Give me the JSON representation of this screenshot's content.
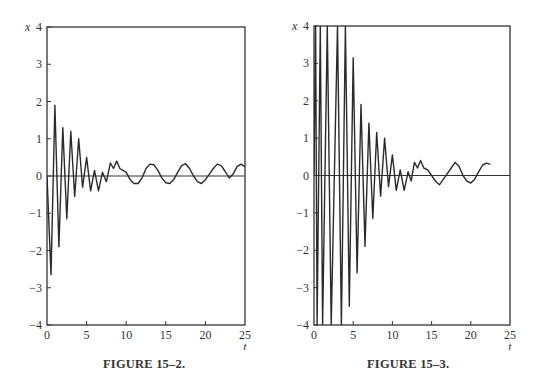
{
  "chart_data": [
    {
      "type": "line",
      "caption": "FIGURE 15–2.",
      "xlabel": "t",
      "ylabel": "x",
      "xlim": [
        0,
        25
      ],
      "ylim": [
        -4,
        4
      ],
      "xticks": [
        0,
        5,
        10,
        15,
        20,
        25
      ],
      "yticks": [
        -4,
        -3,
        -2,
        -1,
        0,
        1,
        2,
        3,
        4
      ],
      "grid": false,
      "baseline": 0,
      "series": [
        {
          "name": "x(t)",
          "points": [
            [
              0,
              0
            ],
            [
              0.5,
              -2.65
            ],
            [
              1.0,
              1.9
            ],
            [
              1.5,
              -1.9
            ],
            [
              2.0,
              1.3
            ],
            [
              2.5,
              -1.15
            ],
            [
              3.0,
              1.2
            ],
            [
              3.5,
              -0.55
            ],
            [
              4.0,
              1.0
            ],
            [
              4.5,
              -0.3
            ],
            [
              5.0,
              0.5
            ],
            [
              5.5,
              -0.4
            ],
            [
              6.0,
              0.15
            ],
            [
              6.5,
              -0.4
            ],
            [
              7.0,
              0.1
            ],
            [
              7.5,
              -0.15
            ],
            [
              8.0,
              0.35
            ],
            [
              8.4,
              0.2
            ],
            [
              8.8,
              0.4
            ],
            [
              9.2,
              0.2
            ],
            [
              9.6,
              0.15
            ],
            [
              10.0,
              0.1
            ],
            [
              10.5,
              -0.1
            ],
            [
              11.0,
              -0.2
            ],
            [
              11.5,
              -0.2
            ],
            [
              12.0,
              -0.05
            ],
            [
              12.5,
              0.2
            ],
            [
              13.0,
              0.32
            ],
            [
              13.5,
              0.3
            ],
            [
              14.0,
              0.15
            ],
            [
              14.5,
              -0.05
            ],
            [
              15.0,
              -0.18
            ],
            [
              15.5,
              -0.2
            ],
            [
              16.0,
              -0.1
            ],
            [
              16.5,
              0.1
            ],
            [
              17.0,
              0.28
            ],
            [
              17.5,
              0.33
            ],
            [
              18.0,
              0.2
            ],
            [
              18.5,
              0.0
            ],
            [
              19.0,
              -0.15
            ],
            [
              19.5,
              -0.2
            ],
            [
              20.0,
              -0.1
            ],
            [
              20.5,
              0.05
            ],
            [
              21.0,
              0.2
            ],
            [
              21.5,
              0.32
            ],
            [
              22.0,
              0.28
            ],
            [
              22.5,
              0.12
            ],
            [
              23.0,
              -0.05
            ],
            [
              23.5,
              0.05
            ],
            [
              24.0,
              0.25
            ],
            [
              24.5,
              0.32
            ],
            [
              25.0,
              0.25
            ]
          ]
        }
      ]
    },
    {
      "type": "line",
      "caption": "FIGURE 15–3.",
      "xlabel": "t",
      "ylabel": "x",
      "xlim": [
        0,
        25
      ],
      "ylim": [
        -4,
        4
      ],
      "xticks": [
        0,
        5,
        10,
        15,
        20,
        25
      ],
      "yticks": [
        -4,
        -3,
        -2,
        -1,
        0,
        1,
        2,
        3,
        4
      ],
      "grid": false,
      "baseline": 0,
      "series": [
        {
          "name": "x(t)",
          "points": [
            [
              0,
              0
            ],
            [
              0.2,
              4.0
            ],
            [
              0.4,
              -4.0
            ],
            [
              0.8,
              4.0
            ],
            [
              1.1,
              -4.0
            ],
            [
              1.7,
              4.0
            ],
            [
              2.2,
              -4.0
            ],
            [
              3.0,
              4.0
            ],
            [
              3.5,
              -4.0
            ],
            [
              4.0,
              4.0
            ],
            [
              4.5,
              -3.5
            ],
            [
              5.0,
              3.15
            ],
            [
              5.5,
              -2.6
            ],
            [
              6.0,
              1.9
            ],
            [
              6.5,
              -1.9
            ],
            [
              7.0,
              1.4
            ],
            [
              7.5,
              -1.15
            ],
            [
              8.0,
              1.15
            ],
            [
              8.5,
              -0.55
            ],
            [
              9.0,
              1.0
            ],
            [
              9.5,
              -0.3
            ],
            [
              10.0,
              0.55
            ],
            [
              10.5,
              -0.4
            ],
            [
              11.0,
              0.15
            ],
            [
              11.5,
              -0.4
            ],
            [
              12.0,
              0.1
            ],
            [
              12.4,
              -0.15
            ],
            [
              12.8,
              0.35
            ],
            [
              13.2,
              0.2
            ],
            [
              13.6,
              0.4
            ],
            [
              14.0,
              0.2
            ],
            [
              14.5,
              0.15
            ],
            [
              15.0,
              0.0
            ],
            [
              15.5,
              -0.15
            ],
            [
              16.0,
              -0.25
            ],
            [
              16.5,
              -0.1
            ],
            [
              17.0,
              0.05
            ],
            [
              17.5,
              0.2
            ],
            [
              18.0,
              0.35
            ],
            [
              18.5,
              0.25
            ],
            [
              19.0,
              0.0
            ],
            [
              19.5,
              -0.15
            ],
            [
              20.0,
              -0.2
            ],
            [
              20.5,
              -0.1
            ],
            [
              21.0,
              0.1
            ],
            [
              21.5,
              0.28
            ],
            [
              22.0,
              0.33
            ],
            [
              22.5,
              0.3
            ]
          ]
        }
      ]
    }
  ],
  "figures": [
    {
      "caption": "FIGURE 15–2.",
      "ylabel": "x",
      "xlabel": "t",
      "ytick_labels": [
        "4",
        "3",
        "2",
        "1",
        "0",
        "−1",
        "−2",
        "−3",
        "−4"
      ],
      "xtick_labels": [
        "0",
        "5",
        "10",
        "15",
        "20",
        "25"
      ]
    },
    {
      "caption": "FIGURE 15–3.",
      "ylabel": "x",
      "xlabel": "t",
      "ytick_labels": [
        "4",
        "3",
        "2",
        "1",
        "0",
        "−1",
        "−2",
        "−3",
        "−4"
      ],
      "xtick_labels": [
        "0",
        "5",
        "10",
        "15",
        "20",
        "25"
      ]
    }
  ],
  "colors": {
    "line": "#2a2a2a",
    "axis": "#333333",
    "background": "#ffffff"
  }
}
